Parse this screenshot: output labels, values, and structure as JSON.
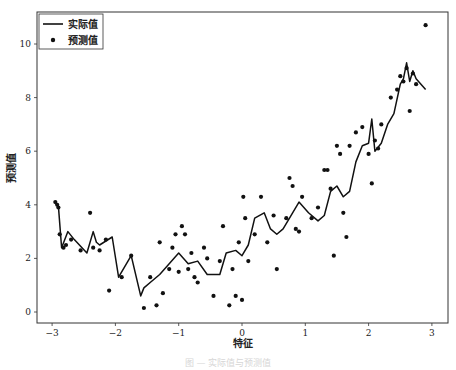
{
  "chart_data": {
    "type": "line+scatter",
    "title": "",
    "xlabel": "特征",
    "ylabel": "预测值",
    "xlim": [
      -3.2,
      3.25
    ],
    "ylim": [
      -0.4,
      11.2
    ],
    "xticks": [
      -3,
      -2,
      -1,
      0,
      1,
      2,
      3
    ],
    "xtick_labels": [
      "−3",
      "−2",
      "−1",
      "0",
      "1",
      "2",
      "3"
    ],
    "yticks": [
      0,
      2,
      4,
      6,
      8,
      10
    ],
    "ytick_labels": [
      "0",
      "2",
      "4",
      "6",
      "8",
      "10"
    ],
    "grid": false,
    "legend_position": "upper left",
    "legend": [
      {
        "label": "实际值",
        "marker": "line"
      },
      {
        "label": "预测值",
        "marker": "dot"
      }
    ],
    "series": [
      {
        "name": "实际值",
        "kind": "line",
        "color": "#111111",
        "x": [
          -2.95,
          -2.93,
          -2.9,
          -2.85,
          -2.75,
          -2.65,
          -2.45,
          -2.35,
          -2.3,
          -2.25,
          -2.05,
          -1.95,
          -1.75,
          -1.6,
          -1.55,
          -1.45,
          -1.3,
          -1.15,
          -1.0,
          -0.85,
          -0.7,
          -0.55,
          -0.45,
          -0.35,
          -0.25,
          -0.1,
          0.0,
          0.1,
          0.2,
          0.35,
          0.45,
          0.55,
          0.65,
          0.75,
          0.9,
          1.05,
          1.2,
          1.3,
          1.4,
          1.5,
          1.6,
          1.7,
          1.8,
          1.9,
          2.0,
          2.05,
          2.1,
          2.2,
          2.3,
          2.4,
          2.5,
          2.55,
          2.6,
          2.65,
          2.7,
          2.75,
          2.9
        ],
        "values": [
          4.1,
          4.0,
          3.95,
          2.4,
          3.0,
          2.7,
          2.2,
          3.0,
          2.6,
          2.5,
          2.8,
          1.3,
          2.1,
          0.6,
          0.9,
          1.1,
          1.4,
          1.8,
          2.2,
          1.8,
          1.9,
          1.4,
          1.4,
          1.4,
          2.2,
          2.3,
          2.1,
          2.5,
          3.5,
          3.7,
          3.1,
          2.9,
          3.1,
          3.5,
          4.1,
          3.7,
          3.4,
          3.6,
          4.5,
          4.7,
          4.3,
          4.5,
          5.6,
          6.2,
          6.3,
          7.2,
          6.0,
          6.3,
          7.0,
          7.4,
          8.5,
          8.7,
          9.3,
          8.6,
          9.0,
          8.7,
          8.3
        ]
      },
      {
        "name": "预测值",
        "kind": "scatter",
        "color": "#111111",
        "x": [
          -2.95,
          -2.92,
          -2.9,
          -2.88,
          -2.82,
          -2.78,
          -2.7,
          -2.55,
          -2.4,
          -2.35,
          -2.25,
          -2.15,
          -2.1,
          -1.9,
          -1.75,
          -1.55,
          -1.45,
          -1.35,
          -1.3,
          -1.25,
          -1.15,
          -1.1,
          -1.05,
          -1.0,
          -0.95,
          -0.9,
          -0.85,
          -0.8,
          -0.75,
          -0.7,
          -0.6,
          -0.55,
          -0.45,
          -0.35,
          -0.3,
          -0.2,
          -0.15,
          -0.1,
          -0.05,
          0.0,
          0.02,
          0.05,
          0.1,
          0.2,
          0.3,
          0.4,
          0.5,
          0.55,
          0.7,
          0.75,
          0.8,
          0.85,
          0.9,
          0.95,
          1.1,
          1.2,
          1.3,
          1.35,
          1.4,
          1.45,
          1.5,
          1.55,
          1.6,
          1.65,
          1.7,
          1.8,
          1.9,
          2.0,
          2.05,
          2.1,
          2.15,
          2.2,
          2.35,
          2.45,
          2.5,
          2.55,
          2.6,
          2.65,
          2.7,
          2.75,
          2.9
        ],
        "values": [
          4.1,
          4.0,
          3.9,
          2.9,
          2.4,
          2.5,
          2.7,
          2.3,
          3.7,
          2.4,
          2.3,
          2.7,
          0.8,
          1.3,
          2.1,
          0.15,
          1.3,
          0.25,
          2.6,
          0.7,
          1.6,
          2.4,
          2.9,
          1.5,
          3.2,
          2.9,
          1.6,
          2.2,
          1.3,
          1.1,
          2.4,
          2.0,
          0.6,
          1.9,
          3.2,
          0.25,
          1.6,
          0.6,
          2.6,
          0.45,
          4.3,
          3.5,
          1.9,
          2.9,
          4.3,
          2.6,
          3.6,
          1.6,
          3.5,
          5.0,
          4.7,
          3.1,
          3.0,
          4.3,
          3.5,
          3.9,
          5.3,
          5.3,
          4.6,
          2.1,
          6.2,
          5.9,
          3.7,
          2.8,
          6.2,
          6.7,
          6.9,
          5.9,
          4.8,
          6.4,
          6.1,
          7.0,
          8.0,
          8.3,
          8.8,
          8.6,
          9.1,
          7.5,
          8.9,
          8.5,
          10.7
        ]
      }
    ]
  },
  "caption": "图 — 实际值与预测值"
}
